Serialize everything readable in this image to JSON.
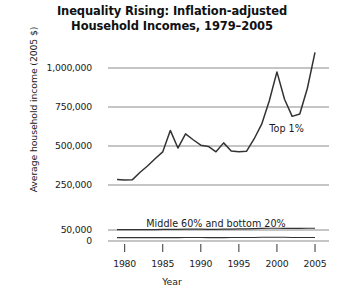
{
  "chart_data": {
    "type": "line",
    "title": "Inequality Rising: Inflation-adjusted Household Incomes, 1979–2005",
    "title_line1": "Inequality Rising: Inflation-adjusted",
    "title_line2": "Household Incomes, 1979–2005",
    "xlabel": "Year",
    "ylabel": "Average household income (2005 $)",
    "xlim": [
      1979,
      2005
    ],
    "xticks": [
      1980,
      1985,
      1990,
      1995,
      2000,
      2005
    ],
    "xticklabels": [
      "1980",
      "1985",
      "1990",
      "1995",
      "2000",
      "2005"
    ],
    "yticks": [
      0,
      50000,
      250000,
      500000,
      750000,
      1000000
    ],
    "yticklabels": [
      "0",
      "50,000",
      "250,000",
      "500,000",
      "750,000",
      "1,000,000"
    ],
    "broken_axis": true,
    "grid": true,
    "grid_color": "#8c8c8c",
    "line_color": "#333333",
    "legend_position": "inline-annotation",
    "annotations": [
      {
        "text": "Top 1%",
        "x": 1999,
        "y": 590000
      },
      {
        "text": "Middle 60% and bottom 20%",
        "x": 1992,
        "y": 95000
      }
    ],
    "x": [
      1979,
      1980,
      1981,
      1982,
      1983,
      1984,
      1985,
      1986,
      1987,
      1988,
      1989,
      1990,
      1991,
      1992,
      1993,
      1994,
      1995,
      1996,
      1997,
      1998,
      1999,
      2000,
      2001,
      2002,
      2003,
      2004,
      2005
    ],
    "series": [
      {
        "name": "Top 1%",
        "values": [
          285000,
          282000,
          283000,
          330000,
          372000,
          418000,
          462000,
          600000,
          487000,
          578000,
          540000,
          505000,
          497000,
          463000,
          520000,
          468000,
          463000,
          466000,
          545000,
          640000,
          790000,
          975000,
          800000,
          690000,
          705000,
          870000,
          1100000
        ]
      },
      {
        "name": "Middle 60%",
        "values": [
          52000,
          52000,
          52000,
          52000,
          52000,
          52000,
          53000,
          53000,
          53000,
          54000,
          54000,
          54000,
          53000,
          53000,
          54000,
          54000,
          55000,
          55000,
          56000,
          57000,
          58000,
          58000,
          57000,
          57000,
          57000,
          58000,
          58000
        ]
      },
      {
        "name": "Bottom 20%",
        "values": [
          15000,
          15000,
          15000,
          15000,
          15000,
          15000,
          15000,
          15000,
          15000,
          16000,
          16000,
          16000,
          15000,
          15000,
          15000,
          16000,
          16000,
          16000,
          16000,
          17000,
          17000,
          17000,
          17000,
          16000,
          16000,
          16000,
          16000
        ]
      }
    ]
  }
}
